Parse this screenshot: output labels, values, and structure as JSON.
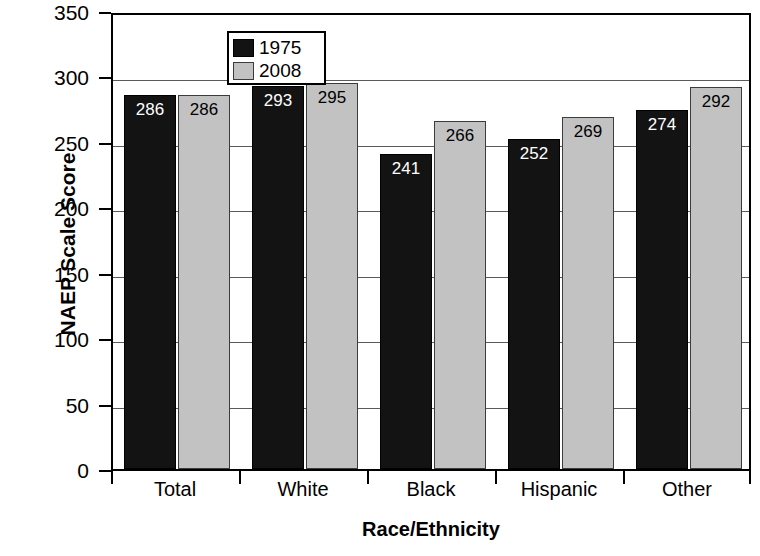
{
  "chart_data": {
    "type": "bar",
    "title": "",
    "xlabel": "Race/Ethnicity",
    "ylabel": "NAEP Scale Score",
    "categories": [
      "Total",
      "White",
      "Black",
      "Hispanic",
      "Other"
    ],
    "series": [
      {
        "name": "1975",
        "color": "#131313",
        "values": [
          286,
          293,
          241,
          252,
          274
        ]
      },
      {
        "name": "2008",
        "color": "#c2c2c2",
        "values": [
          286,
          295,
          266,
          269,
          292
        ]
      }
    ],
    "ylim": [
      0,
      350
    ],
    "yticks": [
      0,
      50,
      100,
      150,
      200,
      250,
      300,
      350
    ],
    "ytick_labels": [
      "0",
      "50",
      "100",
      "150",
      "200",
      "250",
      "300",
      "350"
    ],
    "grid": true,
    "grid_axis": "y",
    "legend_position": "top-left",
    "legend_entries": [
      "1975",
      "2008"
    ]
  },
  "axes": {
    "y_title": "NAEP Scale Score",
    "x_title": "Race/Ethnicity"
  },
  "legend": {
    "entries": [
      {
        "label": "1975",
        "swatch": "black-swatch-icon"
      },
      {
        "label": "2008",
        "swatch": "gray-swatch-icon"
      }
    ]
  }
}
